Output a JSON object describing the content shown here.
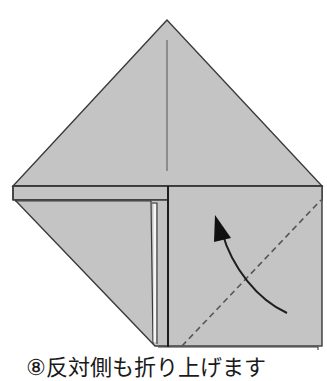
{
  "diagram": {
    "step_number": "⑧",
    "instruction": "反対側も折り上げます",
    "colors": {
      "paper": "#c4c4c4",
      "outline": "#3a3a3a",
      "crease": "#555555",
      "arrow": "#1e1e1e",
      "background": "#ffffff"
    },
    "elements": [
      {
        "name": "top-triangle-flap",
        "description": "Upper triangular flap with center crease"
      },
      {
        "name": "horizontal-band",
        "description": "Folded band across the model"
      },
      {
        "name": "left-folded-flap",
        "description": "Left triangular flap already folded up"
      },
      {
        "name": "right-square-flap",
        "description": "Right square section to be folded"
      },
      {
        "name": "valley-fold-line",
        "description": "Dashed diagonal valley fold line"
      },
      {
        "name": "fold-arrow",
        "description": "Curved arrow indicating fold direction upward"
      }
    ]
  },
  "caption": {
    "text": "⑧反対側も折り上げます"
  }
}
